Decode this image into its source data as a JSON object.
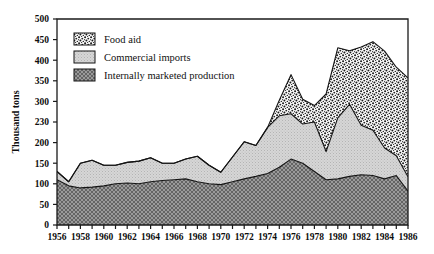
{
  "chart_data": {
    "type": "area",
    "stacked": true,
    "title": "",
    "subtitle": "",
    "xlabel": "",
    "ylabel": "Thousand tons",
    "xlim": [
      1956,
      1986
    ],
    "ylim": [
      0,
      500
    ],
    "grid": false,
    "legend_position": "top-left",
    "y_ticks": [
      0,
      50,
      100,
      150,
      200,
      230,
      300,
      350,
      400,
      450,
      500
    ],
    "y_tick_labels": [
      "0",
      "50",
      "100",
      "150",
      "200",
      "230",
      "300",
      "350",
      "400",
      "450",
      "500"
    ],
    "x_ticks": [
      1956,
      1958,
      1960,
      1962,
      1964,
      1966,
      1968,
      1970,
      1972,
      1974,
      1976,
      1978,
      1980,
      1982,
      1984,
      1986
    ],
    "x_tick_labels": [
      "1956",
      "1958",
      "1960",
      "1962",
      "1964",
      "1966",
      "1968",
      "1970",
      "1972",
      "1974",
      "1976",
      "1978",
      "1980",
      "1982",
      "1984",
      "1986"
    ],
    "x": [
      1956,
      1957,
      1958,
      1959,
      1960,
      1961,
      1962,
      1963,
      1964,
      1965,
      1966,
      1967,
      1968,
      1969,
      1970,
      1971,
      1972,
      1973,
      1974,
      1975,
      1976,
      1977,
      1978,
      1979,
      1980,
      1981,
      1982,
      1983,
      1984,
      1985,
      1986
    ],
    "series": [
      {
        "name": "Internally marketed production",
        "pattern": "dark-crosshatch",
        "color": "#8c8c8c",
        "values": [
          110,
          95,
          90,
          92,
          95,
          100,
          102,
          100,
          105,
          108,
          110,
          112,
          105,
          100,
          98,
          105,
          112,
          118,
          125,
          140,
          160,
          150,
          130,
          110,
          112,
          118,
          122,
          120,
          112,
          120,
          82
        ]
      },
      {
        "name": "Commercial imports",
        "pattern": "light-stipple",
        "color": "#cfcfcf",
        "values": [
          20,
          10,
          60,
          65,
          50,
          45,
          50,
          55,
          58,
          42,
          40,
          48,
          62,
          45,
          30,
          60,
          90,
          75,
          112,
          125,
          110,
          95,
          120,
          68,
          148,
          175,
          120,
          110,
          75,
          48,
          35
        ]
      },
      {
        "name": "Food aid",
        "pattern": "coarse-speckle",
        "color": "#f2f2f2",
        "values": [
          0,
          0,
          0,
          0,
          0,
          0,
          0,
          0,
          0,
          0,
          0,
          0,
          0,
          0,
          0,
          0,
          0,
          0,
          0,
          38,
          95,
          60,
          40,
          140,
          170,
          130,
          190,
          215,
          235,
          215,
          240
        ]
      }
    ],
    "series_totals": [
      130,
      105,
      150,
      157,
      145,
      145,
      152,
      155,
      163,
      150,
      150,
      160,
      167,
      145,
      128,
      165,
      202,
      193,
      237,
      303,
      365,
      305,
      290,
      318,
      430,
      423,
      432,
      445,
      422,
      383,
      357
    ]
  },
  "legend": {
    "items": [
      {
        "label": "Food aid",
        "swatch": "coarse-speckle"
      },
      {
        "label": "Commercial imports",
        "swatch": "light-stipple"
      },
      {
        "label": "Internally marketed production",
        "swatch": "dark-crosshatch"
      }
    ]
  },
  "axes": {
    "y_title": "Thousand tons"
  }
}
